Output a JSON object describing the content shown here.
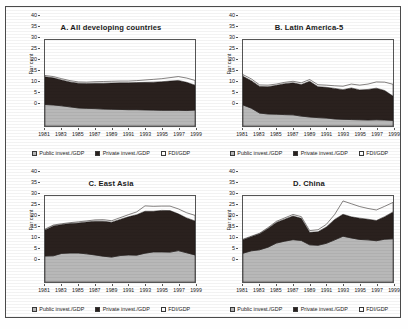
{
  "figure": {
    "axis_label": "Per cent",
    "legend": [
      {
        "key": "public",
        "label": "Public invest./GDP",
        "color": "#b8b8b8"
      },
      {
        "key": "private",
        "label": "Private invest./GDP",
        "color": "#2a211e"
      },
      {
        "key": "fdi",
        "label": "FDI/GDP",
        "color": "#ffffff"
      }
    ],
    "caption": "",
    "years": [
      1981,
      1982,
      1983,
      1984,
      1985,
      1986,
      1987,
      1988,
      1989,
      1990,
      1991,
      1992,
      1993,
      1994,
      1995,
      1996,
      1997,
      1998,
      1999
    ],
    "xtick_labels": [
      "1981",
      "1983",
      "1985",
      "1987",
      "1989",
      "1991",
      "1993",
      "1995",
      "1997",
      "1999"
    ],
    "ytick_labels": [
      "0",
      "5",
      "10",
      "15",
      "20",
      "25",
      "30",
      "35",
      "40"
    ]
  },
  "chart_data": [
    {
      "type": "area",
      "panel": "A",
      "title": "A. All developing countries",
      "xlabel": "",
      "ylabel": "Per cent",
      "ylim": [
        0,
        40
      ],
      "grid": false,
      "legend_position": "bottom",
      "x": [
        1981,
        1982,
        1983,
        1984,
        1985,
        1986,
        1987,
        1988,
        1989,
        1990,
        1991,
        1992,
        1993,
        1994,
        1995,
        1996,
        1997,
        1998,
        1999
      ],
      "series": [
        {
          "name": "Public invest./GDP",
          "color": "#b8b8b8",
          "values": [
            10.0,
            9.8,
            9.4,
            8.9,
            8.4,
            8.2,
            8.1,
            7.9,
            7.8,
            7.7,
            7.6,
            7.6,
            7.5,
            7.4,
            7.3,
            7.3,
            7.3,
            7.2,
            7.4
          ]
        },
        {
          "name": "Private invest./GDP",
          "color": "#2a211e",
          "values": [
            12.9,
            12.6,
            12.0,
            11.6,
            11.5,
            11.6,
            11.8,
            12.0,
            12.2,
            12.4,
            12.5,
            12.6,
            12.8,
            13.0,
            13.3,
            13.6,
            13.9,
            13.1,
            11.6
          ]
        },
        {
          "name": "FDI/GDP",
          "color": "#ffffff",
          "values": [
            0.6,
            0.6,
            0.6,
            0.6,
            0.6,
            0.6,
            0.7,
            0.8,
            0.8,
            0.8,
            0.8,
            0.9,
            1.1,
            1.3,
            1.4,
            1.6,
            1.8,
            2.0,
            2.2
          ]
        }
      ],
      "totals": [
        23.5,
        23.0,
        22.0,
        21.1,
        20.5,
        20.4,
        20.6,
        20.7,
        20.8,
        20.9,
        20.9,
        21.1,
        21.4,
        21.7,
        22.0,
        22.5,
        23.0,
        22.3,
        21.2
      ]
    },
    {
      "type": "area",
      "panel": "B",
      "title": "B. Latin America-5",
      "xlabel": "",
      "ylabel": "Per cent",
      "ylim": [
        0,
        40
      ],
      "grid": false,
      "legend_position": "bottom",
      "x": [
        1981,
        1982,
        1983,
        1984,
        1985,
        1986,
        1987,
        1988,
        1989,
        1990,
        1991,
        1992,
        1993,
        1994,
        1995,
        1996,
        1997,
        1998,
        1999
      ],
      "series": [
        {
          "name": "Public invest./GDP",
          "color": "#b8b8b8",
          "values": [
            9.8,
            8.3,
            6.0,
            5.6,
            5.5,
            5.3,
            5.2,
            4.6,
            4.2,
            3.9,
            3.7,
            3.3,
            3.1,
            3.0,
            2.9,
            2.8,
            2.9,
            2.8,
            2.6
          ]
        },
        {
          "name": "Private invest./GDP",
          "color": "#2a211e",
          "values": [
            13.3,
            12.8,
            12.4,
            12.7,
            13.4,
            14.4,
            14.9,
            14.7,
            16.6,
            14.4,
            14.3,
            14.2,
            13.8,
            14.7,
            13.9,
            14.2,
            14.7,
            13.7,
            11.3
          ]
        },
        {
          "name": "FDI/GDP",
          "color": "#ffffff",
          "values": [
            0.8,
            0.8,
            0.7,
            0.7,
            0.6,
            0.6,
            0.7,
            0.8,
            0.8,
            0.9,
            1.0,
            1.2,
            1.6,
            1.8,
            2.2,
            2.5,
            2.9,
            3.9,
            5.5
          ]
        }
      ],
      "totals": [
        23.9,
        21.9,
        19.1,
        19.0,
        19.5,
        20.3,
        20.8,
        20.1,
        21.6,
        19.2,
        19.0,
        18.7,
        18.5,
        19.5,
        19.0,
        19.5,
        20.5,
        20.4,
        19.4
      ]
    },
    {
      "type": "area",
      "panel": "C",
      "title": "C. East Asia",
      "xlabel": "",
      "ylabel": "Per cent",
      "ylim": [
        0,
        40
      ],
      "grid": false,
      "legend_position": "bottom",
      "x": [
        1981,
        1982,
        1983,
        1984,
        1985,
        1986,
        1987,
        1988,
        1989,
        1990,
        1991,
        1992,
        1993,
        1994,
        1995,
        1996,
        1997,
        1998,
        1999
      ],
      "series": [
        {
          "name": "Public invest./GDP",
          "color": "#b8b8b8",
          "values": [
            12.1,
            12.2,
            13.3,
            13.5,
            13.5,
            13.1,
            12.6,
            12.0,
            11.6,
            12.3,
            12.6,
            12.5,
            13.4,
            14.0,
            14.0,
            13.9,
            14.6,
            13.6,
            12.6
          ]
        },
        {
          "name": "Private invest./GDP",
          "color": "#2a211e",
          "values": [
            12.1,
            13.9,
            13.4,
            13.7,
            14.0,
            14.8,
            15.7,
            16.3,
            16.2,
            16.8,
            17.7,
            18.8,
            19.5,
            18.9,
            19.3,
            19.3,
            17.1,
            16.2,
            15.8
          ]
        },
        {
          "name": "FDI/GDP",
          "color": "#ffffff",
          "values": [
            0.4,
            0.4,
            0.4,
            0.4,
            0.5,
            0.5,
            0.6,
            0.7,
            0.7,
            0.8,
            1.0,
            1.3,
            2.5,
            2.3,
            2.0,
            2.1,
            2.3,
            2.4,
            2.6
          ]
        }
      ],
      "totals": [
        24.6,
        26.5,
        27.1,
        27.6,
        28.0,
        28.4,
        28.9,
        29.0,
        28.5,
        29.9,
        31.3,
        32.6,
        35.4,
        35.2,
        35.3,
        35.3,
        34.0,
        32.2,
        31.0
      ]
    },
    {
      "type": "area",
      "panel": "D",
      "title": "D. China",
      "xlabel": "",
      "ylabel": "Per cent",
      "ylim": [
        0,
        40
      ],
      "grid": false,
      "legend_position": "bottom",
      "x": [
        1981,
        1982,
        1983,
        1984,
        1985,
        1986,
        1987,
        1988,
        1989,
        1990,
        1991,
        1992,
        1993,
        1994,
        1995,
        1996,
        1997,
        1998,
        1999
      ],
      "series": [
        {
          "name": "Public invest./GDP",
          "color": "#b8b8b8",
          "values": [
            13.4,
            14.5,
            15.0,
            16.2,
            18.1,
            19.0,
            19.7,
            19.3,
            17.3,
            17.1,
            18.0,
            19.6,
            21.3,
            20.5,
            19.8,
            19.6,
            19.2,
            19.9,
            20.1
          ]
        },
        {
          "name": "Private invest./GDP",
          "color": "#2a211e",
          "values": [
            6.2,
            6.5,
            7.4,
            8.7,
            9.6,
            10.2,
            11.0,
            10.3,
            5.8,
            6.3,
            7.6,
            9.5,
            10.2,
            9.8,
            9.9,
            9.6,
            9.4,
            10.5,
            12.5
          ]
        },
        {
          "name": "FDI/GDP",
          "color": "#ffffff",
          "values": [
            0.3,
            0.3,
            0.3,
            0.4,
            0.5,
            0.6,
            0.7,
            0.8,
            0.8,
            0.9,
            1.2,
            2.3,
            6.2,
            6.1,
            5.4,
            5.0,
            4.9,
            4.8,
            4.4
          ]
        }
      ],
      "totals": [
        19.9,
        21.3,
        22.7,
        25.3,
        28.2,
        29.8,
        31.4,
        30.4,
        23.9,
        24.3,
        26.8,
        31.4,
        37.7,
        36.4,
        35.1,
        34.2,
        33.5,
        35.2,
        37.0
      ]
    }
  ]
}
